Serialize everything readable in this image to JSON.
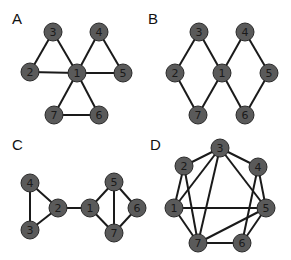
{
  "panels": [
    {
      "label": "A",
      "label_pos": [
        12,
        24
      ],
      "nodes": [
        {
          "id": "1",
          "x": 77,
          "y": 73
        },
        {
          "id": "2",
          "x": 30,
          "y": 72
        },
        {
          "id": "3",
          "x": 53,
          "y": 32
        },
        {
          "id": "4",
          "x": 99,
          "y": 32
        },
        {
          "id": "5",
          "x": 123,
          "y": 73
        },
        {
          "id": "6",
          "x": 99,
          "y": 115
        },
        {
          "id": "7",
          "x": 54,
          "y": 115
        }
      ],
      "edges": [
        [
          "1",
          "2"
        ],
        [
          "1",
          "3"
        ],
        [
          "2",
          "3"
        ],
        [
          "1",
          "4"
        ],
        [
          "4",
          "5"
        ],
        [
          "1",
          "5"
        ],
        [
          "1",
          "6"
        ],
        [
          "1",
          "7"
        ],
        [
          "6",
          "7"
        ]
      ]
    },
    {
      "label": "B",
      "label_pos": [
        148,
        24
      ],
      "nodes": [
        {
          "id": "1",
          "x": 222,
          "y": 73
        },
        {
          "id": "2",
          "x": 175,
          "y": 73
        },
        {
          "id": "3",
          "x": 199,
          "y": 32
        },
        {
          "id": "4",
          "x": 245,
          "y": 32
        },
        {
          "id": "5",
          "x": 269,
          "y": 73
        },
        {
          "id": "6",
          "x": 245,
          "y": 115
        },
        {
          "id": "7",
          "x": 198,
          "y": 115
        }
      ],
      "edges": [
        [
          "2",
          "3"
        ],
        [
          "3",
          "1"
        ],
        [
          "1",
          "4"
        ],
        [
          "4",
          "5"
        ],
        [
          "5",
          "6"
        ],
        [
          "6",
          "1"
        ],
        [
          "1",
          "7"
        ],
        [
          "7",
          "2"
        ]
      ]
    },
    {
      "label": "C",
      "label_pos": [
        12,
        150
      ],
      "nodes": [
        {
          "id": "1",
          "x": 90,
          "y": 208
        },
        {
          "id": "2",
          "x": 58,
          "y": 208
        },
        {
          "id": "3",
          "x": 30,
          "y": 230
        },
        {
          "id": "4",
          "x": 30,
          "y": 183
        },
        {
          "id": "5",
          "x": 114,
          "y": 182
        },
        {
          "id": "6",
          "x": 137,
          "y": 208
        },
        {
          "id": "7",
          "x": 114,
          "y": 233
        }
      ],
      "edges": [
        [
          "4",
          "3"
        ],
        [
          "4",
          "2"
        ],
        [
          "3",
          "2"
        ],
        [
          "2",
          "1"
        ],
        [
          "1",
          "5"
        ],
        [
          "1",
          "7"
        ],
        [
          "5",
          "7"
        ],
        [
          "5",
          "6"
        ],
        [
          "6",
          "7"
        ]
      ]
    },
    {
      "label": "D",
      "label_pos": [
        150,
        150
      ],
      "nodes": [
        {
          "id": "1",
          "x": 174,
          "y": 208
        },
        {
          "id": "2",
          "x": 184,
          "y": 166
        },
        {
          "id": "3",
          "x": 220,
          "y": 148
        },
        {
          "id": "4",
          "x": 258,
          "y": 167
        },
        {
          "id": "5",
          "x": 266,
          "y": 208
        },
        {
          "id": "6",
          "x": 242,
          "y": 243
        },
        {
          "id": "7",
          "x": 198,
          "y": 243
        }
      ],
      "edges": [
        [
          "2",
          "3"
        ],
        [
          "2",
          "1"
        ],
        [
          "2",
          "7"
        ],
        [
          "3",
          "1"
        ],
        [
          "3",
          "7"
        ],
        [
          "3",
          "4"
        ],
        [
          "3",
          "5"
        ],
        [
          "4",
          "5"
        ],
        [
          "4",
          "6"
        ],
        [
          "1",
          "5"
        ],
        [
          "1",
          "7"
        ],
        [
          "5",
          "7"
        ],
        [
          "5",
          "6"
        ],
        [
          "7",
          "6"
        ]
      ]
    }
  ],
  "style": {
    "node_fill": "#5a5a5a",
    "edge_color": "#1a1a1a",
    "node_radius": 9
  }
}
